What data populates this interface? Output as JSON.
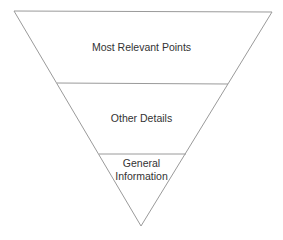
{
  "diagram": {
    "type": "inverted-pyramid",
    "colors": {
      "line": "#9a9a9a",
      "text": "#333333",
      "background": "#ffffff"
    },
    "levels": [
      {
        "label": "Most Relevant Points"
      },
      {
        "label": "Other Details"
      },
      {
        "label_line1": "General",
        "label_line2": "Information"
      }
    ]
  }
}
